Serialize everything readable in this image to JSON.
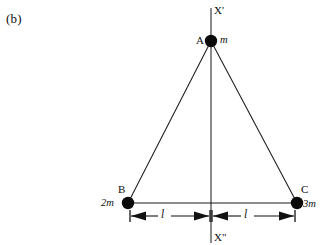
{
  "figure": {
    "panel_label": "(b)",
    "background_color": "#ffffff",
    "stroke_color": "#1a1a1a",
    "width": 323,
    "height": 245
  },
  "axis": {
    "top_label": "X'",
    "bottom_label": "X\"",
    "orientation": "vertical",
    "x_position": 211,
    "y_top": 8,
    "y_bottom": 243
  },
  "vertices": [
    {
      "id": "A",
      "label": "A",
      "mass": "m",
      "x": 211,
      "y": 41,
      "label_side": "left",
      "mass_side": "right"
    },
    {
      "id": "B",
      "label": "B",
      "mass": "2m",
      "x": 128,
      "y": 203,
      "label_side": "above",
      "mass_side": "left"
    },
    {
      "id": "C",
      "label": "C",
      "mass": "3m",
      "x": 297,
      "y": 203,
      "label_side": "above",
      "mass_side": "right"
    }
  ],
  "edges": [
    {
      "from": "A",
      "to": "B"
    },
    {
      "from": "A",
      "to": "C"
    },
    {
      "from": "B",
      "to": "C"
    }
  ],
  "dimensions": [
    {
      "id": "left-span",
      "label": "l",
      "from_x": 130,
      "to_x": 210,
      "y": 216,
      "label_x": 163,
      "label_y": 210
    },
    {
      "id": "right-span",
      "label": "l",
      "from_x": 212,
      "to_x": 295,
      "y": 216,
      "label_x": 246,
      "label_y": 210
    }
  ]
}
